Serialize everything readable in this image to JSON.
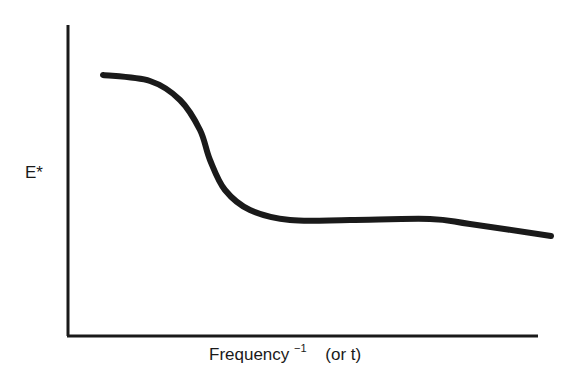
{
  "chart_data": {
    "type": "line",
    "title": "",
    "xlabel": "Frequency⁻¹ (or t)",
    "xlabel_main": "Frequency",
    "xlabel_sup": "−1",
    "xlabel_suffix": "(or t)",
    "ylabel": "E*",
    "grid": false,
    "legend": null,
    "ticks": {
      "x": [],
      "y": []
    },
    "axis_ranges": {
      "x": [
        0,
        1
      ],
      "y": [
        0,
        1
      ]
    },
    "series": [
      {
        "name": "E* curve",
        "color": "#1a1a1a",
        "points_normalized": [
          {
            "x": 0.07,
            "y": 0.84
          },
          {
            "x": 0.17,
            "y": 0.82
          },
          {
            "x": 0.24,
            "y": 0.76
          },
          {
            "x": 0.28,
            "y": 0.66
          },
          {
            "x": 0.3,
            "y": 0.56
          },
          {
            "x": 0.34,
            "y": 0.47
          },
          {
            "x": 0.39,
            "y": 0.4
          },
          {
            "x": 0.47,
            "y": 0.37
          },
          {
            "x": 0.6,
            "y": 0.37
          },
          {
            "x": 0.77,
            "y": 0.37
          },
          {
            "x": 0.86,
            "y": 0.36
          },
          {
            "x": 1.03,
            "y": 0.32
          }
        ],
        "points_px": [
          [
            103,
            75
          ],
          [
            150,
            81
          ],
          [
            180,
            100
          ],
          [
            200,
            130
          ],
          [
            210,
            160
          ],
          [
            225,
            190
          ],
          [
            250,
            210
          ],
          [
            290,
            220
          ],
          [
            350,
            220
          ],
          [
            430,
            219
          ],
          [
            470,
            224
          ],
          [
            551,
            236
          ]
        ]
      }
    ],
    "annotations": []
  },
  "axes": {
    "y_axis": {
      "x": 68,
      "top": 25,
      "bottom": 336
    },
    "x_axis": {
      "y": 336,
      "left": 68,
      "right": 538
    },
    "stroke_color": "#1a1a1a"
  }
}
